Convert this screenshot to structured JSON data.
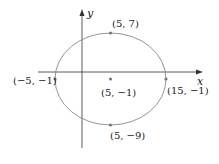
{
  "diagram": {
    "type": "ellipse-graph",
    "axes": {
      "x_label": "x",
      "y_label": "y"
    },
    "ellipse": {
      "center": {
        "x": 5,
        "y": -1,
        "label": "(5, −1)"
      },
      "vertices": [
        {
          "name": "left",
          "x": -5,
          "y": -1,
          "label": "(−5, −1)"
        },
        {
          "name": "right",
          "x": 15,
          "y": -1,
          "label": "(15, −1)"
        }
      ],
      "co_vertices": [
        {
          "name": "top",
          "x": 5,
          "y": 7,
          "label": "(5, 7)"
        },
        {
          "name": "bottom",
          "x": 5,
          "y": -9,
          "label": "(5, −9)"
        }
      ]
    },
    "colors": {
      "axis": "#333333",
      "ellipse": "#888888",
      "point": "#777777",
      "text": "#222222"
    }
  }
}
